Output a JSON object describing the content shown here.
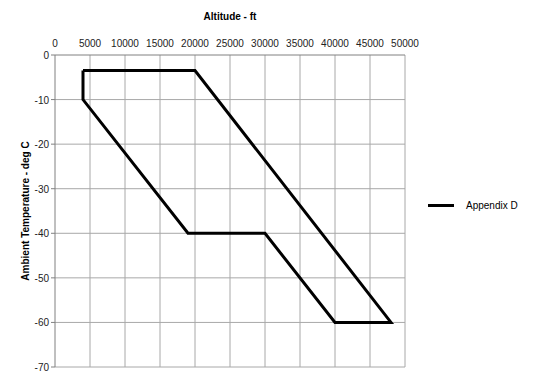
{
  "chart_data": {
    "type": "line",
    "title": "",
    "xlabel": "Altitude - ft",
    "ylabel": "Ambient Temperature - deg C",
    "xlim": [
      0,
      50000
    ],
    "ylim": [
      -70,
      0
    ],
    "x_ticks": [
      0,
      5000,
      10000,
      15000,
      20000,
      25000,
      30000,
      35000,
      40000,
      45000,
      50000
    ],
    "y_ticks": [
      0,
      -10,
      -20,
      -30,
      -40,
      -50,
      -60,
      -70
    ],
    "x_axis_position": "top",
    "grid": true,
    "legend_position": "right",
    "series": [
      {
        "name": "Appendix D",
        "color": "#000000",
        "points": [
          {
            "x": 4000,
            "y": -3.5
          },
          {
            "x": 20000,
            "y": -3.5
          },
          {
            "x": 48000,
            "y": -60
          },
          {
            "x": 40000,
            "y": -60
          },
          {
            "x": 30000,
            "y": -40
          },
          {
            "x": 19000,
            "y": -40
          },
          {
            "x": 4000,
            "y": -10
          },
          {
            "x": 4000,
            "y": -3.5
          }
        ]
      }
    ]
  },
  "legend": {
    "label": "Appendix D"
  }
}
